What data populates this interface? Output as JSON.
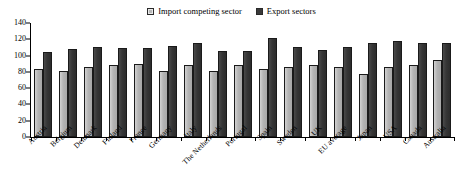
{
  "chart_data": {
    "type": "bar",
    "title": "",
    "subtitle": "",
    "xlabel": "",
    "ylabel": "",
    "ylim": [
      0,
      140
    ],
    "yticks": [
      0,
      20,
      40,
      60,
      80,
      100,
      120,
      140
    ],
    "grid": false,
    "legend_position": "top-center",
    "categories": [
      "Austria",
      "Belgium",
      "Denmark",
      "Finland",
      "France",
      "Germany",
      "Italy",
      "The Netherlands",
      "Portugal",
      "Spain",
      "Sweden",
      "UK",
      "EU average",
      "Japan",
      "USA",
      "Canada",
      "Australia"
    ],
    "series": [
      {
        "name": "Import competing sector",
        "color": "#b4b4b4",
        "values": [
          83,
          81,
          86,
          89,
          90,
          81,
          89,
          81,
          88,
          83,
          86,
          88,
          86,
          77,
          86,
          89,
          94
        ]
      },
      {
        "name": "Export sectors",
        "color": "#333333",
        "values": [
          105,
          108,
          110,
          109,
          109,
          112,
          115,
          106,
          106,
          121,
          111,
          107,
          111,
          116,
          118,
          116,
          116
        ]
      }
    ]
  },
  "legend": {
    "entries": [
      {
        "label": "Import competing sector",
        "swatch": "light"
      },
      {
        "label": "Export sectors",
        "swatch": "dark"
      }
    ]
  },
  "colors": {
    "light_bar": "#b4b4b4",
    "dark_bar": "#333333",
    "axis": "#000000",
    "background": "#ffffff"
  }
}
